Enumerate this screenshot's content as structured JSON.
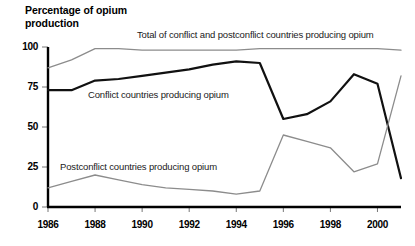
{
  "chart_data": {
    "type": "line",
    "title": "Percentage of opium\nproduction",
    "xlabel": "",
    "ylabel": "Percentage of opium production",
    "ylim": [
      0,
      100
    ],
    "xlim": [
      1986,
      2001
    ],
    "grid": false,
    "legend_position": "inline-annotations",
    "yticks": [
      "0",
      "25",
      "50",
      "75",
      "100"
    ],
    "ytick_values": [
      0,
      25,
      50,
      75,
      100
    ],
    "xticks": [
      "1986",
      "1988",
      "1990",
      "1992",
      "1994",
      "1996",
      "1998",
      "2000"
    ],
    "xtick_values": [
      1986,
      1988,
      1990,
      1992,
      1994,
      1996,
      1998,
      2000
    ],
    "x": [
      1986,
      1987,
      1988,
      1989,
      1990,
      1991,
      1992,
      1993,
      1994,
      1995,
      1996,
      1997,
      1998,
      1999,
      2000,
      2001
    ],
    "series": [
      {
        "name": "Total of conflict and postconflict countries producing opium",
        "color": "#8c8c8c",
        "width": 1.3,
        "values": [
          87,
          92,
          99,
          99,
          98,
          98,
          98,
          98,
          98,
          99,
          99,
          99,
          99,
          99,
          99,
          98
        ]
      },
      {
        "name": "Conflict countries producing opium",
        "color": "#111111",
        "width": 2.2,
        "values": [
          73,
          73,
          79,
          80,
          82,
          84,
          86,
          89,
          91,
          90,
          55,
          58,
          66,
          83,
          77,
          18
        ]
      },
      {
        "name": "Postconflict countries producing opium",
        "color": "#8c8c8c",
        "width": 1.3,
        "values": [
          12,
          16,
          20,
          17,
          14,
          12,
          11,
          10,
          8,
          10,
          45,
          41,
          37,
          22,
          27,
          82
        ]
      }
    ],
    "annotations": [
      {
        "text": "Total of conflict and postconflict countries producing opium",
        "x": 137,
        "y": 29
      },
      {
        "text": "Conflict countries producing opium",
        "x": 88,
        "y": 89
      },
      {
        "text": "Postconflict countries producing opium",
        "x": 60,
        "y": 161
      }
    ]
  }
}
